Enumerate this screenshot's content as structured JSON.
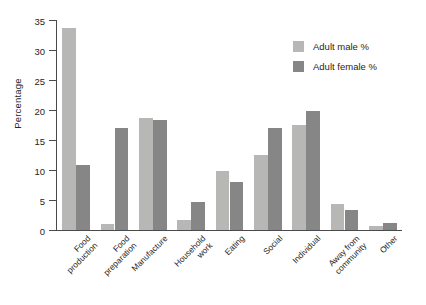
{
  "chart_data": {
    "type": "bar",
    "title": "",
    "xlabel": "",
    "ylabel": "Percentage",
    "ylim": [
      0,
      35
    ],
    "yticks": [
      0,
      5,
      10,
      15,
      20,
      25,
      30,
      35
    ],
    "grid": false,
    "legend_position": "top-right",
    "categories": [
      "Food\nproduction",
      "Food\npreparation",
      "Manufacture",
      "Household\nwork",
      "Eating",
      "Social",
      "Individual",
      "Away from\ncommunity",
      "Other"
    ],
    "series": [
      {
        "name": "Adult male %",
        "color": "#b7b7b5",
        "values": [
          33.6,
          1.0,
          18.6,
          1.7,
          9.8,
          12.5,
          17.5,
          4.4,
          0.7
        ]
      },
      {
        "name": "Adult female %",
        "color": "#868686",
        "values": [
          10.8,
          17.0,
          18.3,
          4.7,
          8.0,
          17.0,
          19.8,
          3.3,
          1.2
        ]
      }
    ]
  },
  "axis": {
    "y_label": "Percentage"
  }
}
